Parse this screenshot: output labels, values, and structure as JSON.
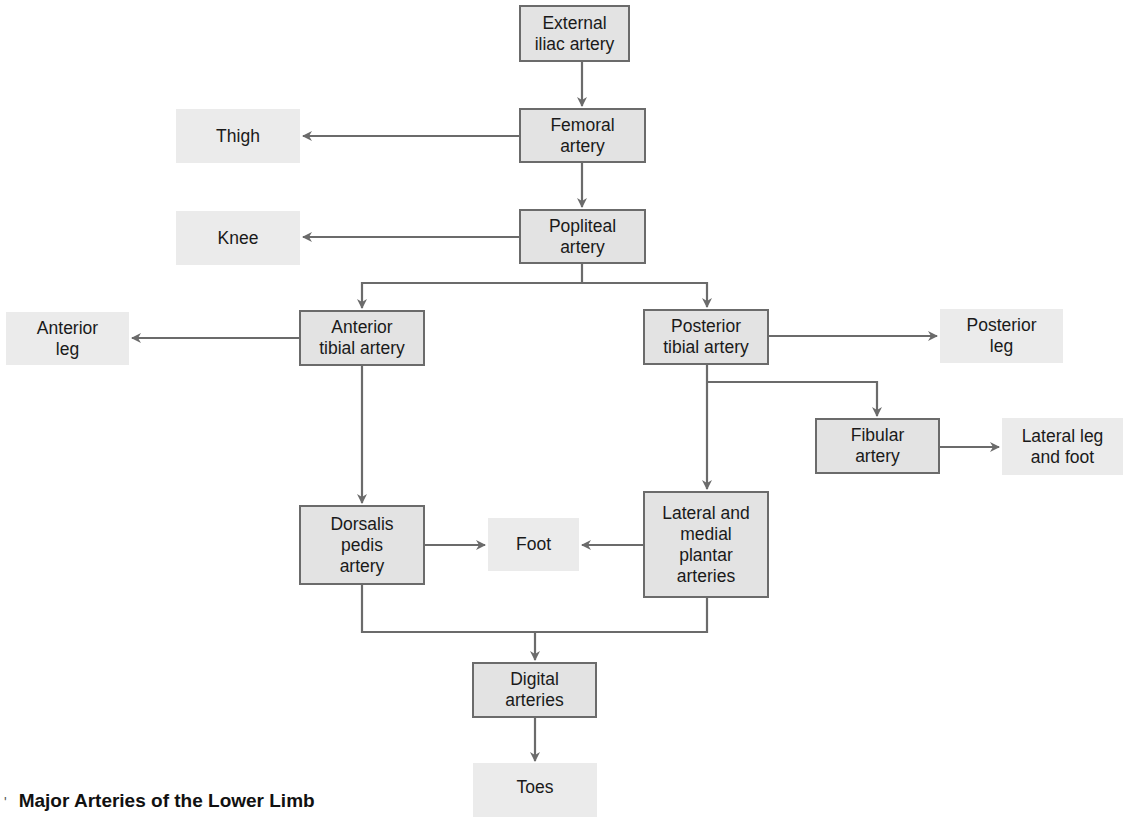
{
  "title": "Major Arteries of the Lower Limb",
  "caption_mark": "'",
  "colors": {
    "artery_fill": "#e3e3e3",
    "artery_border": "#6b6b6b",
    "region_fill": "#ebebeb",
    "connector": "#6b6b6b"
  },
  "nodes": {
    "external_iliac": {
      "label": "External\niliac artery",
      "type": "artery"
    },
    "femoral": {
      "label": "Femoral\nartery",
      "type": "artery"
    },
    "thigh": {
      "label": "Thigh",
      "type": "region"
    },
    "popliteal": {
      "label": "Popliteal\nartery",
      "type": "artery"
    },
    "knee": {
      "label": "Knee",
      "type": "region"
    },
    "anterior_tibial": {
      "label": "Anterior\ntibial artery",
      "type": "artery"
    },
    "anterior_leg": {
      "label": "Anterior\nleg",
      "type": "region"
    },
    "posterior_tibial": {
      "label": "Posterior\ntibial artery",
      "type": "artery"
    },
    "posterior_leg": {
      "label": "Posterior\nleg",
      "type": "region"
    },
    "fibular": {
      "label": "Fibular\nartery",
      "type": "artery"
    },
    "lateral_leg_foot": {
      "label": "Lateral leg\nand foot",
      "type": "region"
    },
    "dorsalis_pedis": {
      "label": "Dorsalis\npedis\nartery",
      "type": "artery"
    },
    "foot": {
      "label": "Foot",
      "type": "region"
    },
    "plantar": {
      "label": "Lateral and\nmedial\nplantar\narteries",
      "type": "artery"
    },
    "digital": {
      "label": "Digital\narteries",
      "type": "artery"
    },
    "toes": {
      "label": "Toes",
      "type": "region"
    }
  },
  "edges": [
    {
      "from": "External iliac artery",
      "to": "Femoral artery"
    },
    {
      "from": "Femoral artery",
      "to": "Thigh"
    },
    {
      "from": "Femoral artery",
      "to": "Popliteal artery"
    },
    {
      "from": "Popliteal artery",
      "to": "Knee"
    },
    {
      "from": "Popliteal artery",
      "to": "Anterior tibial artery"
    },
    {
      "from": "Popliteal artery",
      "to": "Posterior tibial artery"
    },
    {
      "from": "Anterior tibial artery",
      "to": "Anterior leg"
    },
    {
      "from": "Anterior tibial artery",
      "to": "Dorsalis pedis artery"
    },
    {
      "from": "Posterior tibial artery",
      "to": "Posterior leg"
    },
    {
      "from": "Posterior tibial artery",
      "to": "Fibular artery"
    },
    {
      "from": "Posterior tibial artery",
      "to": "Lateral and medial plantar arteries"
    },
    {
      "from": "Fibular artery",
      "to": "Lateral leg and foot"
    },
    {
      "from": "Dorsalis pedis artery",
      "to": "Foot"
    },
    {
      "from": "Lateral and medial plantar arteries",
      "to": "Foot"
    },
    {
      "from": "Dorsalis pedis artery",
      "to": "Digital arteries"
    },
    {
      "from": "Lateral and medial plantar arteries",
      "to": "Digital arteries"
    },
    {
      "from": "Digital arteries",
      "to": "Toes"
    }
  ]
}
